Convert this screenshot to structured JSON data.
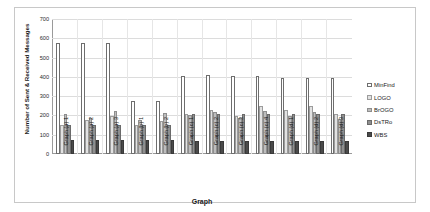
{
  "chart_data": {
    "type": "bar",
    "title": "",
    "xlabel": "Graph",
    "ylabel": "Number of Sent & Received Messages",
    "ylim": [
      0,
      700
    ],
    "ytick_step": 100,
    "yticks": [
      0,
      100,
      200,
      300,
      400,
      500,
      600,
      700
    ],
    "grid": true,
    "legend_position": "right",
    "categories": [
      "Graph (a) 1",
      "Graph (a) 2",
      "Graph (a) 3",
      "Graph (b) 1",
      "Graph (b) 2",
      "Graph (c) 1",
      "Graph (c) 2",
      "Graph (c) 3",
      "Graph (c) 4",
      "Graph (d) 1",
      "Graph (d) 2",
      "Graph (d) 3"
    ],
    "series": [
      {
        "name": "MinFind",
        "color": "#ffffff",
        "values": [
          575,
          575,
          575,
          275,
          275,
          405,
          408,
          405,
          405,
          395,
          395,
          393
        ]
      },
      {
        "name": "LOGO",
        "color": "#e2e2e2",
        "values": [
          150,
          175,
          195,
          150,
          170,
          210,
          228,
          198,
          248,
          228,
          248,
          208
        ]
      },
      {
        "name": "BrOGO",
        "color": "#bdbdbd",
        "values": [
          205,
          185,
          225,
          175,
          215,
          202,
          220,
          185,
          225,
          198,
          220,
          182
        ]
      },
      {
        "name": "DsTRo",
        "color": "#8f8f8f",
        "values": [
          150,
          150,
          150,
          150,
          150,
          208,
          210,
          208,
          208,
          205,
          205,
          205
        ]
      },
      {
        "name": "WBS",
        "color": "#4a4a4a",
        "values": [
          75,
          75,
          75,
          72,
          72,
          70,
          70,
          68,
          68,
          68,
          68,
          68
        ]
      }
    ]
  }
}
